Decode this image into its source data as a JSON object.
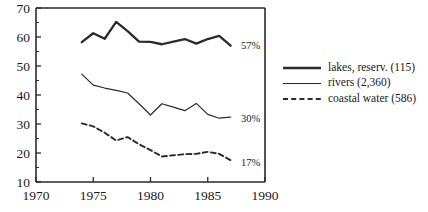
{
  "chart_data": {
    "type": "line",
    "title": "",
    "subtitle": "",
    "xlabel": "",
    "ylabel": "",
    "xlim": [
      1970,
      1990
    ],
    "ylim": [
      10,
      70
    ],
    "x_ticks": [
      1970,
      1975,
      1980,
      1985,
      1990
    ],
    "x_tick_labels": [
      "1970",
      "1975",
      "1980",
      "1985",
      "1990"
    ],
    "y_ticks": [
      10,
      20,
      30,
      40,
      50,
      60,
      70
    ],
    "y_tick_labels": [
      "10",
      "20",
      "30",
      "40",
      "50",
      "60",
      "70"
    ],
    "y_minor_ticks": [
      15,
      25,
      35,
      45,
      55,
      65
    ],
    "grid": false,
    "legend_position": "right",
    "x": [
      1974,
      1975,
      1976,
      1977,
      1978,
      1979,
      1980,
      1981,
      1982,
      1983,
      1984,
      1985,
      1986,
      1987
    ],
    "series": [
      {
        "name": "lakes, reserv. (115)",
        "style": "thick-solid",
        "end_label": "57%",
        "values": [
          58.2,
          61.3,
          59.4,
          65.2,
          62.0,
          58.4,
          58.3,
          57.5,
          58.4,
          59.3,
          57.7,
          59.3,
          60.4,
          57.0
        ]
      },
      {
        "name": "rivers (2,360)",
        "style": "thin-solid",
        "end_label": "30%",
        "values": [
          47.2,
          43.4,
          42.4,
          41.6,
          40.7,
          37.0,
          33.1,
          37.0,
          35.8,
          34.6,
          37.1,
          33.3,
          32.0,
          32.4
        ]
      },
      {
        "name": "coastal water (586)",
        "style": "dashed",
        "end_label": "17%",
        "values": [
          30.2,
          29.2,
          27.0,
          24.3,
          25.5,
          23.0,
          21.0,
          18.8,
          19.2,
          19.6,
          19.7,
          20.4,
          19.7,
          17.5
        ]
      }
    ],
    "annotations": [
      {
        "text": "57%",
        "x": 1987.9,
        "y": 56.0
      },
      {
        "text": "30%",
        "x": 1987.9,
        "y": 30.6
      },
      {
        "text": "17%",
        "x": 1987.9,
        "y": 15.6
      }
    ],
    "legend_entries": [
      {
        "label": "lakes, reserv. (115)",
        "style": "thick-solid"
      },
      {
        "label": "rivers (2,360)",
        "style": "thin-solid"
      },
      {
        "label": "coastal water (586)",
        "style": "dashed"
      }
    ],
    "colors": {
      "ink": "#2b2b2b",
      "background": "#ffffff"
    }
  }
}
